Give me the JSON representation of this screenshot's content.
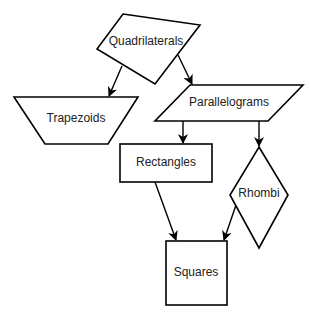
{
  "diagram": {
    "type": "hierarchy",
    "nodes": [
      {
        "id": "quadrilaterals",
        "label": "Quadrilaterals",
        "shape": "irregular-quadrilateral"
      },
      {
        "id": "trapezoids",
        "label": "Trapezoids",
        "shape": "trapezoid"
      },
      {
        "id": "parallelograms",
        "label": "Parallelograms",
        "shape": "parallelogram"
      },
      {
        "id": "rectangles",
        "label": "Rectangles",
        "shape": "rectangle"
      },
      {
        "id": "rhombi",
        "label": "Rhombi",
        "shape": "rhombus"
      },
      {
        "id": "squares",
        "label": "Squares",
        "shape": "square"
      }
    ],
    "edges": [
      {
        "from": "quadrilaterals",
        "to": "trapezoids"
      },
      {
        "from": "quadrilaterals",
        "to": "parallelograms"
      },
      {
        "from": "parallelograms",
        "to": "rectangles"
      },
      {
        "from": "parallelograms",
        "to": "rhombi"
      },
      {
        "from": "rectangles",
        "to": "squares"
      },
      {
        "from": "rhombi",
        "to": "squares"
      }
    ],
    "colors": {
      "stroke": "#000000",
      "fill": "#ffffff",
      "text": "#222222"
    }
  }
}
